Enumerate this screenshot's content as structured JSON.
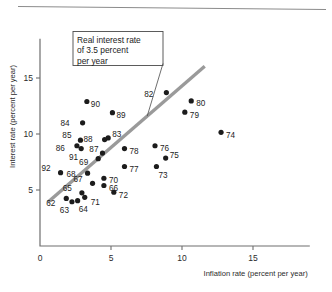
{
  "chart_data": {
    "type": "scatter",
    "title": "",
    "xlabel": "Inflation rate (percent per year)",
    "ylabel": "Interest rate (percent per year)",
    "xlim": [
      0,
      19
    ],
    "ylim": [
      0,
      18.5
    ],
    "xticks": [
      0,
      5,
      10,
      15
    ],
    "yticks": [
      5,
      10,
      15
    ],
    "origin_label": "0",
    "grid": false,
    "legend": null,
    "annotation": {
      "text_lines": [
        "Real interest rate",
        "of 3.5 percent",
        "per year"
      ],
      "full_text": "Real interest rate of 3.5 percent per year"
    },
    "trendline": {
      "label": "Real interest rate of 3.5 percent per year",
      "x": [
        0.55,
        11.6
      ],
      "y": [
        3.9,
        16.05
      ],
      "color": "#9a9a9a"
    },
    "point_color": "#1c1c1c",
    "points": [
      {
        "label": "92",
        "x": 1.45,
        "y": 6.55,
        "lx": -10,
        "ly": -5
      },
      {
        "label": "62",
        "x": 1.85,
        "y": 4.25,
        "lx": -11,
        "ly": 5
      },
      {
        "label": "63",
        "x": 2.25,
        "y": 3.95,
        "lx": -3,
        "ly": 8
      },
      {
        "label": "64",
        "x": 2.65,
        "y": 4.05,
        "lx": 1,
        "ly": 8.5
      },
      {
        "label": "65",
        "x": 2.95,
        "y": 4.75,
        "lx": -10,
        "ly": -4.5
      },
      {
        "label": "71",
        "x": 3.15,
        "y": 4.35,
        "lx": 6,
        "ly": 5
      },
      {
        "label": "86",
        "x": 2.6,
        "y": 8.95,
        "lx": -12,
        "ly": 2
      },
      {
        "label": "85",
        "x": 2.85,
        "y": 9.45,
        "lx": -9,
        "ly": -5
      },
      {
        "label": "91",
        "x": 2.9,
        "y": 8.7,
        "lx": -3,
        "ly": 8
      },
      {
        "label": "84",
        "x": 3.0,
        "y": 11.0,
        "lx": -13,
        "ly": 0
      },
      {
        "label": "90",
        "x": 3.3,
        "y": 12.9,
        "lx": 4,
        "ly": 2
      },
      {
        "label": "68",
        "x": 3.35,
        "y": 6.5,
        "lx": -12,
        "ly": 1
      },
      {
        "label": "67",
        "x": 3.7,
        "y": 5.6,
        "lx": -10,
        "ly": -4
      },
      {
        "label": "69",
        "x": 4.1,
        "y": 7.8,
        "lx": -10,
        "ly": 3.5
      },
      {
        "label": "87",
        "x": 4.4,
        "y": 8.3,
        "lx": -4,
        "ly": -4.5
      },
      {
        "label": "88",
        "x": 4.55,
        "y": 9.5,
        "lx": -12,
        "ly": -0.5
      },
      {
        "label": "70",
        "x": 4.5,
        "y": 6.05,
        "lx": 5,
        "ly": 2
      },
      {
        "label": "66",
        "x": 4.5,
        "y": 5.4,
        "lx": 5,
        "ly": 2.5
      },
      {
        "label": "83",
        "x": 4.8,
        "y": 9.65,
        "lx": 4,
        "ly": -3.5
      },
      {
        "label": "89",
        "x": 5.1,
        "y": 11.9,
        "lx": 4,
        "ly": 2
      },
      {
        "label": "72",
        "x": 5.2,
        "y": 4.8,
        "lx": 5,
        "ly": 3
      },
      {
        "label": "78",
        "x": 5.95,
        "y": 8.7,
        "lx": 5,
        "ly": 2.5
      },
      {
        "label": "77",
        "x": 5.95,
        "y": 7.1,
        "lx": 5,
        "ly": 3
      },
      {
        "label": "76",
        "x": 8.1,
        "y": 8.95,
        "lx": 5,
        "ly": 2
      },
      {
        "label": "73",
        "x": 8.2,
        "y": 7.1,
        "lx": 2,
        "ly": 8.5
      },
      {
        "label": "75",
        "x": 8.85,
        "y": 7.85,
        "lx": 4,
        "ly": -3.5
      },
      {
        "label": "82",
        "x": 8.9,
        "y": 13.7,
        "lx": -13,
        "ly": 1
      },
      {
        "label": "79",
        "x": 10.2,
        "y": 11.95,
        "lx": 5,
        "ly": 3
      },
      {
        "label": "80",
        "x": 10.65,
        "y": 12.95,
        "lx": 5,
        "ly": 2
      },
      {
        "label": "74",
        "x": 12.75,
        "y": 10.15,
        "lx": 5,
        "ly": 2.5
      }
    ]
  }
}
